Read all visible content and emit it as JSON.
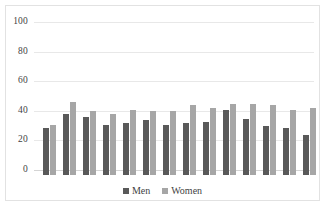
{
  "chart_data": {
    "type": "bar",
    "title": "",
    "subtitle": "",
    "xlabel": "",
    "ylabel": "",
    "ylim": [
      0,
      100
    ],
    "yticks": [
      0,
      20,
      40,
      60,
      80,
      100
    ],
    "grid": true,
    "legend_position": "bottom-center",
    "categories": [
      "1",
      "2",
      "3",
      "4",
      "5",
      "6",
      "7",
      "8",
      "9",
      "10",
      "11",
      "12",
      "13",
      "14"
    ],
    "category_labels_visible": false,
    "series": [
      {
        "name": "Men",
        "color": "#595959",
        "values": [
          32,
          41,
          39,
          34,
          35,
          37,
          34,
          35,
          36,
          44,
          38,
          33,
          32,
          27
        ]
      },
      {
        "name": "Women",
        "color": "#a6a6a6",
        "values": [
          34,
          49,
          43,
          41,
          44,
          43,
          43,
          47,
          45,
          48,
          48,
          47,
          44,
          45
        ]
      }
    ]
  },
  "legend": {
    "entries": [
      {
        "label": "Men"
      },
      {
        "label": "Women"
      }
    ]
  },
  "colors": {
    "men": "#595959",
    "women": "#a6a6a6",
    "gridline": "#e8e8e8",
    "axis_text": "#3f3f3f",
    "border": "#e2e2e2",
    "background": "#ffffff"
  }
}
